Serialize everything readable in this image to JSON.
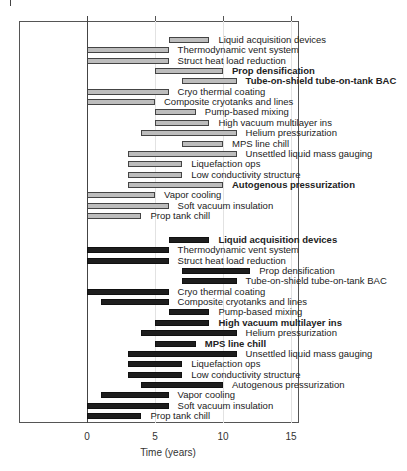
{
  "chart_data": {
    "type": "bar",
    "orientation": "horizontal-gantt",
    "title": "",
    "xlabel": "Time (years)",
    "ylabel": "",
    "xlim": [
      0,
      15
    ],
    "xticks": [
      0,
      5,
      10,
      15
    ],
    "grid": "vertical light",
    "legend": null,
    "series": [
      {
        "name": "gray",
        "color": "#bdbdbd",
        "tasks": [
          {
            "label": "Liquid acquisition devices",
            "start": 6,
            "end": 9,
            "bold": false
          },
          {
            "label": "Thermodynamic vent system",
            "start": 0,
            "end": 6,
            "bold": false
          },
          {
            "label": "Struct heat load reduction",
            "start": 0,
            "end": 6,
            "bold": false
          },
          {
            "label": "Prop densification",
            "start": 5,
            "end": 10,
            "bold": true
          },
          {
            "label": "Tube-on-shield tube-on-tank BAC",
            "start": 7,
            "end": 11,
            "bold": true
          },
          {
            "label": "Cryo thermal coating",
            "start": 0,
            "end": 6,
            "bold": false
          },
          {
            "label": "Composite cryotanks and lines",
            "start": 0,
            "end": 5,
            "bold": false
          },
          {
            "label": "Pump-based mixing",
            "start": 5,
            "end": 8,
            "bold": false
          },
          {
            "label": "High vacuum multilayer ins",
            "start": 5,
            "end": 9,
            "bold": false
          },
          {
            "label": "Helium pressurization",
            "start": 4,
            "end": 11,
            "bold": false
          },
          {
            "label": "MPS line chill",
            "start": 7,
            "end": 10,
            "bold": false
          },
          {
            "label": "Unsettled liquid mass gauging",
            "start": 3,
            "end": 11,
            "bold": false
          },
          {
            "label": "Liquefaction ops",
            "start": 3,
            "end": 7,
            "bold": false
          },
          {
            "label": "Low conductivity structure",
            "start": 3,
            "end": 7,
            "bold": false
          },
          {
            "label": "Autogenous pressurization",
            "start": 3,
            "end": 10,
            "bold": true
          },
          {
            "label": "Vapor cooling",
            "start": 0,
            "end": 5,
            "bold": false
          },
          {
            "label": "Soft vacuum insulation",
            "start": 0,
            "end": 6,
            "bold": false
          },
          {
            "label": "Prop tank chill",
            "start": 0,
            "end": 4,
            "bold": false
          }
        ]
      },
      {
        "name": "black",
        "color": "#1e1e1e",
        "tasks": [
          {
            "label": "Liquid acquisition devices",
            "start": 6,
            "end": 9,
            "bold": true
          },
          {
            "label": "Thermodynamic vent system",
            "start": 0,
            "end": 6,
            "bold": false
          },
          {
            "label": "Struct heat load reduction",
            "start": 0,
            "end": 6,
            "bold": false
          },
          {
            "label": "Prop densification",
            "start": 7,
            "end": 12,
            "bold": false
          },
          {
            "label": "Tube-on-shield tube-on-tank BAC",
            "start": 7,
            "end": 11,
            "bold": false
          },
          {
            "label": "Cryo thermal coating",
            "start": 0,
            "end": 6,
            "bold": false
          },
          {
            "label": "Composite cryotanks and lines",
            "start": 1,
            "end": 6,
            "bold": false
          },
          {
            "label": "Pump-based mixing",
            "start": 6,
            "end": 9,
            "bold": false
          },
          {
            "label": "High vacuum multilayer ins",
            "start": 5,
            "end": 9,
            "bold": true
          },
          {
            "label": "Helium pressurization",
            "start": 4,
            "end": 11,
            "bold": false
          },
          {
            "label": "MPS line chill",
            "start": 5,
            "end": 8,
            "bold": true
          },
          {
            "label": "Unsettled liquid mass gauging",
            "start": 3,
            "end": 11,
            "bold": false
          },
          {
            "label": "Liquefaction ops",
            "start": 3,
            "end": 7,
            "bold": false
          },
          {
            "label": "Low conductivity structure",
            "start": 3,
            "end": 7,
            "bold": false
          },
          {
            "label": "Autogenous pressurization",
            "start": 4,
            "end": 10,
            "bold": false
          },
          {
            "label": "Vapor cooling",
            "start": 1,
            "end": 6,
            "bold": false
          },
          {
            "label": "Soft vacuum insulation",
            "start": 0,
            "end": 6,
            "bold": false
          },
          {
            "label": "Prop tank chill",
            "start": 0,
            "end": 4,
            "bold": false
          }
        ]
      }
    ]
  },
  "axis": {
    "tick_labels": [
      "0",
      "5",
      "10",
      "15"
    ],
    "title": "Time (years)"
  }
}
